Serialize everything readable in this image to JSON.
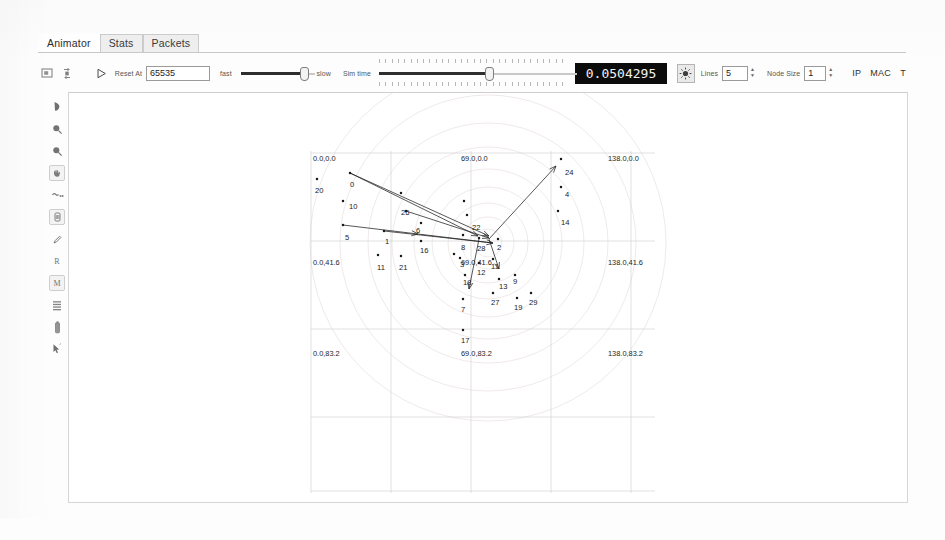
{
  "app": {
    "name": "NetAnim Animator"
  },
  "tabs": [
    {
      "label": "Animator",
      "active": true
    },
    {
      "label": "Stats",
      "active": false
    },
    {
      "label": "Packets",
      "active": false
    }
  ],
  "toolbar": {
    "icons": [
      {
        "name": "screenshot-icon"
      },
      {
        "name": "reload-icon"
      }
    ],
    "play_label": "play-icon",
    "reset_label": "Reset At",
    "reset_value": "65535",
    "speed": {
      "fast_label": "fast",
      "slow_label": "slow",
      "position_pct": 88
    },
    "sim_time_label": "Sim time",
    "sim_time_position_pct": 55,
    "time_display": "0.0504295",
    "packet_button": "sun-icon",
    "lines_label": "Lines",
    "lines_value": "5",
    "node_size_label": "Node Size",
    "node_size_value": "1",
    "ip_label": "IP",
    "mac_label": "MAC",
    "t_label": "T"
  },
  "left_tools": [
    {
      "name": "pointer-tool",
      "glyph": "arrow"
    },
    {
      "name": "zoom-in-tool",
      "glyph": "magnifier-plus"
    },
    {
      "name": "zoom-out-tool",
      "glyph": "magnifier-minus"
    },
    {
      "name": "pan-hand-tool",
      "glyph": "hand",
      "boxed": true
    },
    {
      "name": "route-path-tool",
      "glyph": "hand-small"
    },
    {
      "name": "node-trajectory-tool",
      "glyph": "node-box",
      "boxed": true
    },
    {
      "name": "pencil-tool",
      "glyph": "pencil"
    },
    {
      "name": "show-routing-tool",
      "glyph": "R"
    },
    {
      "name": "show-mac-tool",
      "glyph": "M",
      "boxed": true
    },
    {
      "name": "grid-tool",
      "glyph": "grid"
    },
    {
      "name": "battery-tool",
      "glyph": "battery"
    },
    {
      "name": "select-tool",
      "glyph": "cursor"
    }
  ],
  "canvas": {
    "coordinate_labels": [
      {
        "text": "0.0,0.0",
        "x": 10,
        "y": 68
      },
      {
        "text": "69.0,0.0",
        "x": 158,
        "y": 68
      },
      {
        "text": "138.0,0.0",
        "x": 305,
        "y": 68
      },
      {
        "text": "0.0,41.6",
        "x": 10,
        "y": 172
      },
      {
        "text": "69.0,41.6",
        "x": 158,
        "y": 172
      },
      {
        "text": "138.0,41.6",
        "x": 305,
        "y": 172
      },
      {
        "text": "0.0,83.2",
        "x": 10,
        "y": 263
      },
      {
        "text": "69.0,83.2",
        "x": 158,
        "y": 263
      },
      {
        "text": "138.0,83.2",
        "x": 305,
        "y": 263
      }
    ],
    "grid": {
      "vertical_x": [
        8,
        88,
        168,
        248,
        328
      ],
      "horizontal_y": [
        60,
        148,
        236,
        324,
        398
      ],
      "x_start": 8,
      "x_end": 352,
      "y_start": 58,
      "y_end": 400
    },
    "rings": {
      "cx": 185,
      "cy": 150,
      "radii": [
        14,
        26,
        40,
        56,
        74,
        96,
        120,
        148,
        178
      ]
    },
    "nodes": [
      {
        "id": "0",
        "x": 47,
        "y": 80,
        "lx": 47,
        "ly": 94
      },
      {
        "id": "20",
        "x": 14,
        "y": 86,
        "lx": 12,
        "ly": 100
      },
      {
        "id": "10",
        "x": 40,
        "y": 108,
        "lx": 46,
        "ly": 116
      },
      {
        "id": "5",
        "x": 40,
        "y": 132,
        "lx": 42,
        "ly": 147
      },
      {
        "id": "26",
        "x": 103,
        "y": 118,
        "lx": 98,
        "ly": 122
      },
      {
        "id": "6",
        "x": 118,
        "y": 130,
        "lx": 113,
        "ly": 140
      },
      {
        "id": "1",
        "x": 81,
        "y": 138,
        "lx": 82,
        "ly": 151
      },
      {
        "id": "11",
        "x": 75,
        "y": 162,
        "lx": 74,
        "ly": 177
      },
      {
        "id": "21",
        "x": 98,
        "y": 163,
        "lx": 96,
        "ly": 177
      },
      {
        "id": "16",
        "x": 118,
        "y": 148,
        "lx": 117,
        "ly": 160
      },
      {
        "id": "22",
        "x": 164,
        "y": 122,
        "lx": 169,
        "ly": 137
      },
      {
        "id": "8",
        "x": 160,
        "y": 142,
        "lx": 158,
        "ly": 157
      },
      {
        "id": "28",
        "x": 176,
        "y": 145,
        "lx": 174,
        "ly": 158
      },
      {
        "id": "2",
        "x": 195,
        "y": 146,
        "lx": 194,
        "ly": 157
      },
      {
        "id": "3",
        "x": 157,
        "y": 165,
        "lx": 157,
        "ly": 174
      },
      {
        "id": "12",
        "x": 176,
        "y": 170,
        "lx": 174,
        "ly": 182
      },
      {
        "id": "11b",
        "x": 190,
        "y": 166,
        "lx": 188,
        "ly": 176
      },
      {
        "id": "18",
        "x": 162,
        "y": 182,
        "lx": 160,
        "ly": 192
      },
      {
        "id": "13",
        "x": 196,
        "y": 186,
        "lx": 196,
        "ly": 196
      },
      {
        "id": "9",
        "x": 212,
        "y": 182,
        "lx": 210,
        "ly": 191
      },
      {
        "id": "27",
        "x": 190,
        "y": 200,
        "lx": 188,
        "ly": 212
      },
      {
        "id": "19",
        "x": 214,
        "y": 205,
        "lx": 211,
        "ly": 217
      },
      {
        "id": "29",
        "x": 228,
        "y": 200,
        "lx": 226,
        "ly": 212
      },
      {
        "id": "7",
        "x": 160,
        "y": 206,
        "lx": 158,
        "ly": 219
      },
      {
        "id": "17",
        "x": 160,
        "y": 237,
        "lx": 158,
        "ly": 250
      },
      {
        "id": "24",
        "x": 258,
        "y": 66,
        "lx": 262,
        "ly": 82
      },
      {
        "id": "4",
        "x": 258,
        "y": 94,
        "lx": 262,
        "ly": 104
      },
      {
        "id": "14",
        "x": 255,
        "y": 118,
        "lx": 258,
        "ly": 132
      },
      {
        "id": "15",
        "x": 161,
        "y": 108,
        "lx": 161,
        "ly": 108
      },
      {
        "id": "23",
        "x": 151,
        "y": 161,
        "lx": 151,
        "ly": 161
      },
      {
        "id": "25",
        "x": 98,
        "y": 100,
        "lx": 98,
        "ly": 100
      }
    ],
    "packet_links": [
      {
        "from": [
          47,
          80
        ],
        "to": [
          186,
          143
        ],
        "arrow": "to"
      },
      {
        "from": [
          47,
          80
        ],
        "to": [
          175,
          143
        ],
        "arrow": "to"
      },
      {
        "from": [
          103,
          118
        ],
        "to": [
          186,
          145
        ],
        "arrow": "from"
      },
      {
        "from": [
          40,
          132
        ],
        "to": [
          190,
          150
        ],
        "arrow": "mid"
      },
      {
        "from": [
          81,
          138
        ],
        "to": [
          190,
          150
        ],
        "arrow": "to"
      },
      {
        "from": [
          186,
          146
        ],
        "to": [
          253,
          73
        ],
        "arrow": "to"
      },
      {
        "from": [
          176,
          146
        ],
        "to": [
          166,
          196
        ],
        "arrow": "to"
      },
      {
        "from": [
          186,
          146
        ],
        "to": [
          196,
          176
        ],
        "arrow": "to"
      }
    ]
  }
}
